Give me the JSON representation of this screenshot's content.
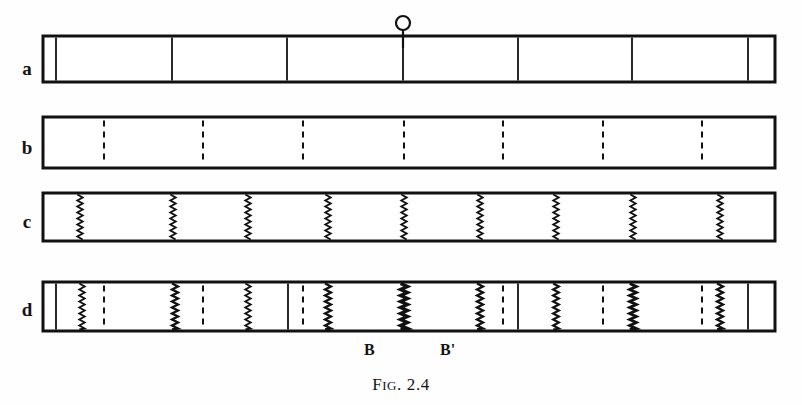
{
  "figure": {
    "caption_prefix": "F",
    "caption_smallcaps": "IG",
    "caption_suffix": ". 2.4",
    "caption_full": "FIG. 2.4",
    "origin_marker_label": "O",
    "ink_color": "#111111",
    "paper_color": "#ffffff"
  },
  "geometry": {
    "bar_left": 43,
    "bar_right": 775,
    "bar_stroke": 3,
    "canvas_width": 802,
    "canvas_height": 405
  },
  "rows": [
    {
      "id": "a",
      "label": "a",
      "label_x": 14,
      "label_y": 69,
      "top": 36,
      "height": 46,
      "dividers": [
        {
          "x": 56,
          "style": "solid",
          "weight": 1.8
        },
        {
          "x": 172,
          "style": "solid",
          "weight": 1.8
        },
        {
          "x": 287,
          "style": "solid",
          "weight": 1.8
        },
        {
          "x": 403,
          "style": "solid",
          "weight": 1.8
        },
        {
          "x": 518,
          "style": "solid",
          "weight": 1.8
        },
        {
          "x": 632,
          "style": "solid",
          "weight": 1.8
        },
        {
          "x": 748,
          "style": "solid",
          "weight": 1.8
        }
      ]
    },
    {
      "id": "b",
      "label": "b",
      "label_x": 14,
      "label_y": 148,
      "top": 117,
      "height": 51,
      "dividers": [
        {
          "x": 104,
          "style": "dashed",
          "weight": 2.0
        },
        {
          "x": 203,
          "style": "dashed",
          "weight": 2.0
        },
        {
          "x": 303,
          "style": "dashed",
          "weight": 2.0
        },
        {
          "x": 404,
          "style": "dashed",
          "weight": 2.0
        },
        {
          "x": 503,
          "style": "dashed",
          "weight": 2.0
        },
        {
          "x": 603,
          "style": "dashed",
          "weight": 2.0
        },
        {
          "x": 702,
          "style": "dashed",
          "weight": 2.0
        }
      ]
    },
    {
      "id": "c",
      "label": "c",
      "label_x": 14,
      "label_y": 222,
      "top": 193,
      "height": 48,
      "dividers": [
        {
          "x": 80,
          "style": "zigzag",
          "weight": 1.9
        },
        {
          "x": 173,
          "style": "zigzag",
          "weight": 1.9
        },
        {
          "x": 248,
          "style": "zigzag",
          "weight": 1.9
        },
        {
          "x": 328,
          "style": "zigzag",
          "weight": 1.9
        },
        {
          "x": 404,
          "style": "zigzag",
          "weight": 1.9
        },
        {
          "x": 480,
          "style": "zigzag",
          "weight": 1.9
        },
        {
          "x": 556,
          "style": "zigzag",
          "weight": 1.9
        },
        {
          "x": 633,
          "style": "zigzag",
          "weight": 1.9
        },
        {
          "x": 720,
          "style": "zigzag",
          "weight": 1.9
        }
      ]
    },
    {
      "id": "d",
      "label": "d",
      "label_x": 14,
      "label_y": 310,
      "top": 282,
      "height": 49,
      "dividers": [
        {
          "x": 56,
          "style": "solid",
          "weight": 1.8
        },
        {
          "x": 82,
          "style": "zigzag",
          "weight": 1.9
        },
        {
          "x": 104,
          "style": "dashed",
          "weight": 2.0
        },
        {
          "x": 175,
          "style": "zigzag",
          "weight": 2.4
        },
        {
          "x": 203,
          "style": "dashed",
          "weight": 2.0
        },
        {
          "x": 248,
          "style": "zigzag",
          "weight": 1.9
        },
        {
          "x": 288,
          "style": "solid",
          "weight": 1.8
        },
        {
          "x": 303,
          "style": "dashed",
          "weight": 2.0
        },
        {
          "x": 328,
          "style": "zigzag",
          "weight": 2.4
        },
        {
          "x": 404,
          "style": "zigzag",
          "weight": 3.4
        },
        {
          "x": 480,
          "style": "zigzag",
          "weight": 2.4
        },
        {
          "x": 503,
          "style": "dashed",
          "weight": 2.0
        },
        {
          "x": 518,
          "style": "solid",
          "weight": 1.8
        },
        {
          "x": 556,
          "style": "zigzag",
          "weight": 2.2
        },
        {
          "x": 603,
          "style": "dashed",
          "weight": 2.0
        },
        {
          "x": 633,
          "style": "zigzag",
          "weight": 3.0
        },
        {
          "x": 702,
          "style": "dashed",
          "weight": 2.0
        },
        {
          "x": 720,
          "style": "zigzag",
          "weight": 2.4
        },
        {
          "x": 748,
          "style": "solid",
          "weight": 1.8
        }
      ]
    }
  ],
  "annotations": {
    "origin": {
      "label": "O",
      "x": 403,
      "circle_cy": 23,
      "circle_r": 7,
      "tick_top": 30,
      "tick_bottom": 48
    },
    "segment_marks": [
      {
        "label": "B",
        "x": 364,
        "y": 342
      },
      {
        "label": "B'",
        "x": 440,
        "y": 342
      }
    ]
  }
}
